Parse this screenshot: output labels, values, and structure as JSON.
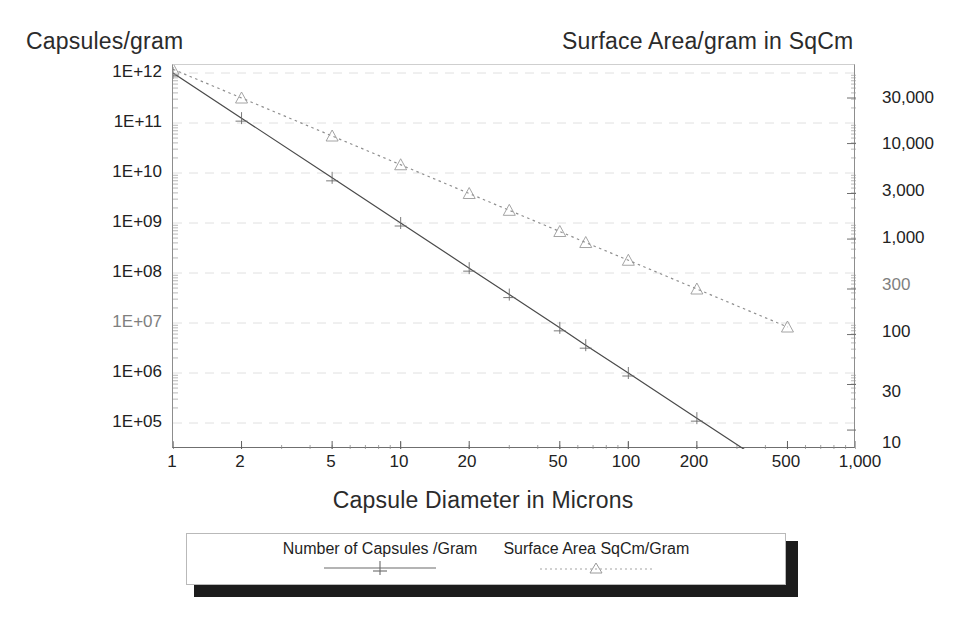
{
  "chart_data": {
    "type": "line",
    "title": "",
    "xlabel": "Capsule Diameter in Microns",
    "ylabel_left": "Capsules/gram",
    "ylabel_right": "Surface Area/gram in SqCm",
    "xscale": "log",
    "yscale": "log",
    "xlim": [
      1,
      1000
    ],
    "grid": true,
    "legend_position": "bottom",
    "x_tick_labels": [
      "1",
      "2",
      "5",
      "10",
      "20",
      "50",
      "100",
      "200",
      "500",
      "1,000"
    ],
    "x_tick_values": [
      1,
      2,
      5,
      10,
      20,
      50,
      100,
      200,
      500,
      1000
    ],
    "y_left_tick_labels": [
      "1E+12",
      "1E+11",
      "1E+10",
      "1E+09",
      "1E+08",
      "1E+07",
      "1E+06",
      "1E+05"
    ],
    "y_left_tick_values": [
      1000000000000.0,
      100000000000.0,
      10000000000.0,
      1000000000.0,
      100000000.0,
      10000000.0,
      1000000.0,
      100000.0
    ],
    "y_right_tick_labels": [
      "30,000",
      "10,000",
      "3,000",
      "1,000",
      "300",
      "100",
      "30",
      "10"
    ],
    "y_right_tick_values": [
      30000,
      10000,
      3000,
      1000,
      300,
      100,
      30,
      10
    ],
    "series": [
      {
        "name": "Number of Capsules /Gram",
        "axis": "left",
        "style": "solid",
        "marker": "plus",
        "x": [
          1,
          2,
          5,
          10,
          20,
          30,
          50,
          65,
          100,
          200,
          500
        ],
        "y": [
          1000000000000.0,
          125000000000.0,
          8000000000.0,
          1000000000.0,
          125000000.0,
          37000000.0,
          8000000.0,
          3600000.0,
          1000000.0,
          125000.0,
          8000.0
        ]
      },
      {
        "name": "Surface Area SqCm/Gram",
        "axis": "right",
        "style": "dotted",
        "marker": "triangle",
        "x": [
          1,
          2,
          5,
          10,
          20,
          30,
          50,
          65,
          100,
          200,
          500
        ],
        "y": [
          60000,
          30000,
          12000,
          6000,
          3000,
          2000,
          1200,
          920,
          600,
          300,
          120
        ]
      }
    ]
  },
  "axes": {
    "left_title": "Capsules/gram",
    "right_title": "Surface Area/gram in SqCm",
    "bottom_title": "Capsule Diameter in Microns"
  },
  "legend": {
    "entries": [
      {
        "label": "Number of Capsules /Gram",
        "style": "solid",
        "marker": "plus"
      },
      {
        "label": "Surface Area SqCm/Gram",
        "style": "dotted",
        "marker": "triangle"
      }
    ]
  },
  "colors": {
    "line_capsules": "#4a4a4a",
    "line_surface": "#8a8a8a",
    "grid": "#d8d8d8",
    "axis": "#7a7a7a",
    "text": "#1f1f1f",
    "legend_shadow": "#1c1c1c"
  }
}
